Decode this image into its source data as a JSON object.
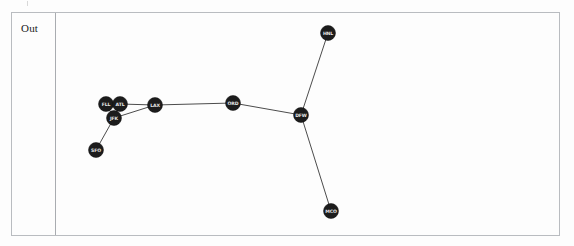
{
  "cell": {
    "prompt_label": "Out",
    "border_color": "#b9bcc0",
    "background_color": "#fdfdfd"
  },
  "chart_data": {
    "type": "scatter",
    "title": "",
    "xlabel": "",
    "ylabel": "",
    "grid": false,
    "legend": null,
    "node_color": "#1c1c1c",
    "edge_color": "#4c4c4c",
    "label_color": "#e8e8e8",
    "nodes": [
      {
        "id": "FLL",
        "label": "FLL",
        "x": 50,
        "y": 91,
        "r": 7.5
      },
      {
        "id": "ATL",
        "label": "ATL",
        "x": 64,
        "y": 91,
        "r": 7.5
      },
      {
        "id": "JFK",
        "label": "JFK",
        "x": 58,
        "y": 105,
        "r": 7.5
      },
      {
        "id": "SFO",
        "label": "SFO",
        "x": 40,
        "y": 137,
        "r": 7.5
      },
      {
        "id": "LAX",
        "label": "LAX",
        "x": 99,
        "y": 92,
        "r": 7.5
      },
      {
        "id": "ORD",
        "label": "ORD",
        "x": 177,
        "y": 90,
        "r": 7.5
      },
      {
        "id": "DFW",
        "label": "DFW",
        "x": 245,
        "y": 102,
        "r": 7.5
      },
      {
        "id": "HNL",
        "label": "HNL",
        "x": 272,
        "y": 20,
        "r": 7.5
      },
      {
        "id": "MCO",
        "label": "MCO",
        "x": 275,
        "y": 198,
        "r": 7.5
      }
    ],
    "edges": [
      {
        "source": "SFO",
        "target": "JFK"
      },
      {
        "source": "JFK",
        "target": "FLL"
      },
      {
        "source": "JFK",
        "target": "ATL"
      },
      {
        "source": "JFK",
        "target": "LAX"
      },
      {
        "source": "ATL",
        "target": "LAX"
      },
      {
        "source": "LAX",
        "target": "ORD"
      },
      {
        "source": "ORD",
        "target": "DFW"
      },
      {
        "source": "DFW",
        "target": "HNL"
      },
      {
        "source": "DFW",
        "target": "MCO"
      }
    ]
  }
}
